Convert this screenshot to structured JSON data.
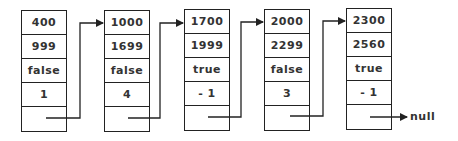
{
  "diagram": {
    "type": "linked-list",
    "nodes": [
      {
        "cells": [
          "400",
          "999",
          "false",
          "1",
          ""
        ]
      },
      {
        "cells": [
          "1000",
          "1699",
          "false",
          "4",
          ""
        ]
      },
      {
        "cells": [
          "1700",
          "1999",
          "true",
          "- 1",
          ""
        ]
      },
      {
        "cells": [
          "2000",
          "2299",
          "false",
          "3",
          ""
        ]
      },
      {
        "cells": [
          "2300",
          "2560",
          "true",
          "- 1",
          ""
        ]
      }
    ],
    "terminator": "null",
    "colors": {
      "line": "#222222",
      "text": "#333333",
      "background": "#ffffff"
    }
  }
}
